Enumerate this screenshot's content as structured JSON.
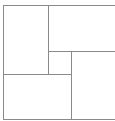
{
  "diagram": {
    "type": "rectangular-subdivision",
    "width": 115,
    "height": 121,
    "line_color": "#8a8a8a",
    "background": "#ffffff",
    "lines": [
      {
        "name": "outer-top-border",
        "orientation": "h",
        "x": 3,
        "y": 5,
        "length": 112
      },
      {
        "name": "outer-left-border",
        "orientation": "v",
        "x": 3,
        "y": 5,
        "length": 114
      },
      {
        "name": "outer-bottom-border",
        "orientation": "h",
        "x": 3,
        "y": 119,
        "length": 112
      },
      {
        "name": "upper-left-divider",
        "orientation": "v",
        "x": 48,
        "y": 5,
        "length": 70
      },
      {
        "name": "upper-right-divider",
        "orientation": "h",
        "x": 48,
        "y": 51,
        "length": 67
      },
      {
        "name": "center-vertical-divider",
        "orientation": "v",
        "x": 71,
        "y": 51,
        "length": 68
      },
      {
        "name": "lower-left-divider",
        "orientation": "h",
        "x": 3,
        "y": 74,
        "length": 69
      }
    ],
    "regions": [
      {
        "name": "top-left-panel"
      },
      {
        "name": "top-right-panel"
      },
      {
        "name": "center-small-panel"
      },
      {
        "name": "bottom-left-panel"
      },
      {
        "name": "bottom-right-panel"
      }
    ]
  }
}
